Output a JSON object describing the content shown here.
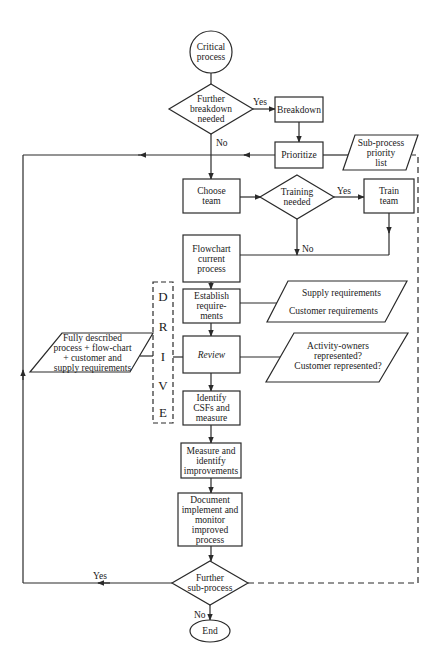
{
  "diagram": {
    "type": "flowchart",
    "nodes": {
      "start": {
        "shape": "circle",
        "label": "Critical\nprocess"
      },
      "further_breakdown": {
        "shape": "diamond",
        "label": "Further\nbreakdown\nneeded"
      },
      "breakdown": {
        "shape": "rect",
        "label": "Breakdown"
      },
      "prioritize": {
        "shape": "rect",
        "label": "Prioritize"
      },
      "subprocess_list": {
        "shape": "parallelogram",
        "label": "Sub-process\npriority\nlist"
      },
      "choose_team": {
        "shape": "rect",
        "label": "Choose\nteam"
      },
      "training_needed": {
        "shape": "diamond",
        "label": "Training\nneeded"
      },
      "train_team": {
        "shape": "rect",
        "label": "Train\nteam"
      },
      "flowchart_current": {
        "shape": "rect",
        "label": "Flowchart\ncurrent\nprocess"
      },
      "establish_req": {
        "shape": "rect",
        "label": "Establish\nrequire-\nments"
      },
      "requirements_io": {
        "shape": "parallelogram",
        "label_top": "Supply requirements",
        "label_bottom": "Customer requirements"
      },
      "review": {
        "shape": "rect",
        "label": "Review"
      },
      "fully_described": {
        "shape": "parallelogram",
        "label": "Fully described\nprocess + flow-chart\n+ customer and\nsupply requirements"
      },
      "activity_owners": {
        "shape": "parallelogram",
        "label": "Activity-owners\nrepresented?\nCustomer represented?"
      },
      "identify_csfs": {
        "shape": "rect",
        "label": "Identify\nCSFs and\nmeasure"
      },
      "measure_identify": {
        "shape": "rect",
        "label": "Measure and\nidentify\nimprovements"
      },
      "document": {
        "shape": "rect",
        "label": "Document\nimplement and\nmonitor\nimproved\nprocess"
      },
      "further_subprocess": {
        "shape": "diamond",
        "label": "Further\nsub-process"
      },
      "end": {
        "shape": "ellipse",
        "label": "End"
      }
    },
    "drive_letters": [
      "D",
      "R",
      "I",
      "V",
      "E"
    ],
    "edge_labels": {
      "breakdown_yes": "Yes",
      "breakdown_no": "No",
      "training_yes": "Yes",
      "training_no": "No",
      "subprocess_yes": "Yes",
      "subprocess_no": "No"
    },
    "colors": {
      "line": "#2a2a2a",
      "background": "#ffffff"
    }
  }
}
